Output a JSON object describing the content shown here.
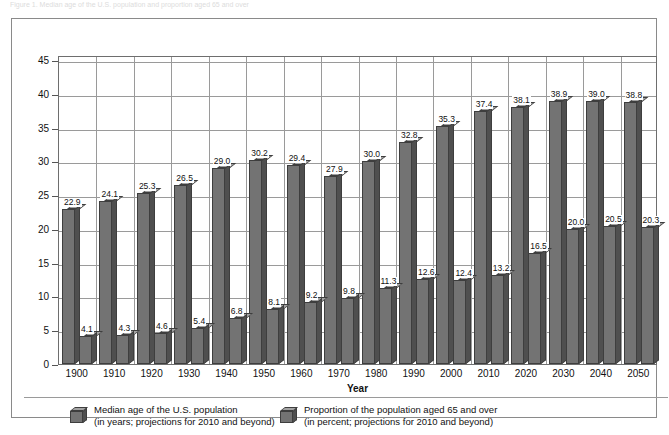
{
  "top_caption": "Figure 1. Median age of the U.S. population and proportion aged 65 and over",
  "chart_data": {
    "type": "bar",
    "title": "",
    "xlabel": "Year",
    "ylabel": "",
    "ylim": [
      0,
      45
    ],
    "yticks": [
      0,
      5,
      10,
      15,
      20,
      25,
      30,
      35,
      40,
      45
    ],
    "ytick_labels": [
      "0",
      "5",
      "10",
      "15",
      "20",
      "25",
      "30",
      "35",
      "40",
      "45"
    ],
    "grid": true,
    "legend_position": "bottom",
    "categories": [
      "1900",
      "1910",
      "1920",
      "1930",
      "1940",
      "1950",
      "1960",
      "1970",
      "1980",
      "1990",
      "2000",
      "2010",
      "2020",
      "2030",
      "2040",
      "2050"
    ],
    "series": [
      {
        "name": "Median age of the U.S. population",
        "unit_note": "in years; projections for 2010 and beyond",
        "values": [
          22.9,
          24.1,
          25.3,
          26.5,
          29.0,
          30.2,
          29.4,
          27.9,
          30.0,
          32.8,
          35.3,
          37.4,
          38.1,
          38.9,
          39.0,
          38.8
        ],
        "labels": [
          "22.9",
          "24.1",
          "25.3",
          "26.5",
          "29.0",
          "30.2",
          "29.4",
          "27.9",
          "30.0",
          "32.8",
          "35.3",
          "37.4",
          "38.1",
          "38.9",
          "39.0",
          "38.8"
        ],
        "color": "#737373"
      },
      {
        "name": "Proportion of the population aged 65 and over",
        "unit_note": "in percent; projections for 2010 and beyond",
        "values": [
          4.1,
          4.3,
          4.6,
          5.4,
          6.8,
          8.1,
          9.2,
          9.8,
          11.3,
          12.6,
          12.4,
          13.2,
          16.5,
          20.0,
          20.5,
          20.3
        ],
        "labels": [
          "4.1",
          "4.3",
          "4.6",
          "5.4",
          "6.8",
          "8.1",
          "9.2",
          "9.8",
          "11.3",
          "12.6",
          "12.4",
          "13.2",
          "16.5",
          "20.0",
          "20.5",
          "20.3"
        ],
        "color": "#737373"
      }
    ]
  },
  "axis": {
    "x_title": "Year"
  },
  "legend": {
    "entries": [
      {
        "line1": "Median age of the U.S. population",
        "line2": "(in years; projections for 2010 and beyond)"
      },
      {
        "line1": "Proportion of the population aged 65 and over",
        "line2": "(in percent; projections for 2010 and beyond)"
      }
    ]
  },
  "colors": {
    "bar_front": "#737373",
    "bar_side": "#4f4f4f",
    "bar_top": "#a3a3a3",
    "bar_outline": "#3e3e3e",
    "grid": "#9a9a9a",
    "frame": "#8a8a8a",
    "background": "#ffffff"
  }
}
